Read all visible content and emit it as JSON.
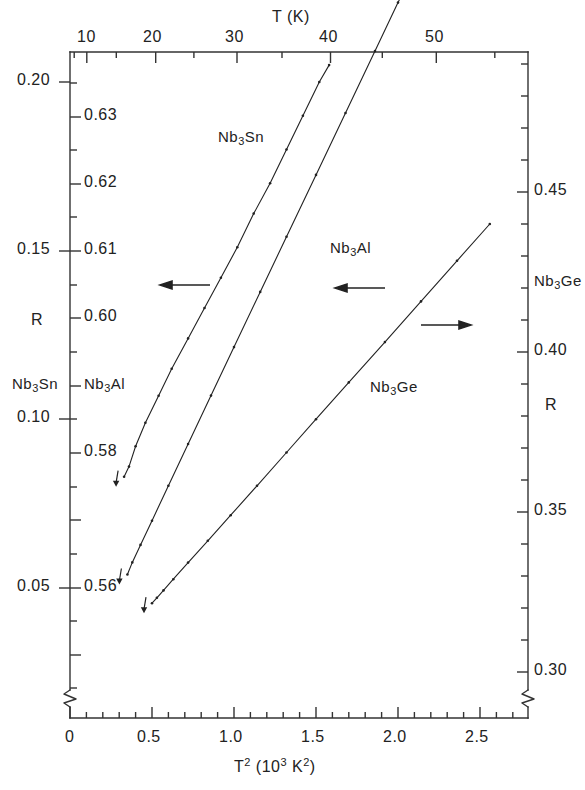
{
  "figure": {
    "background": "#ffffff",
    "ink": "#222222"
  },
  "chart_data": {
    "type": "line",
    "title": "",
    "subtitle": "",
    "xlabel_top": "T (K)",
    "xlabel_bottom": "T² (10³ K²)",
    "ylabel_left_primary": "R",
    "ylabel_right": "R",
    "grid": false,
    "legend_position": "inline-annotations",
    "axes": {
      "top": {
        "label": "T (K)",
        "ticks": [
          10,
          20,
          30,
          40,
          50
        ],
        "tick_labels": [
          "10",
          "20",
          "30",
          "40",
          "50"
        ],
        "minor_step": 5,
        "range": [
          0,
          53
        ]
      },
      "bottom": {
        "label": "T² (10³ K²)",
        "ticks": [
          0,
          0.5,
          1.0,
          1.5,
          2.0,
          2.5
        ],
        "tick_labels": [
          "0",
          "0.5",
          "1.0",
          "1.5",
          "2.0",
          "2.5"
        ],
        "minor_step": 0.1,
        "range": [
          0,
          2.8
        ],
        "axis_break": true
      },
      "left_outer": {
        "series": "Nb3Sn",
        "label": "Nb₃Sn",
        "ticks": [
          0.2,
          0.15,
          0.1,
          0.05
        ],
        "tick_labels": [
          "0.20",
          "0.15",
          "0.10",
          "0.05"
        ],
        "minor_step": 0.0125,
        "range": [
          0.035,
          0.214
        ]
      },
      "left_inner": {
        "series": "Nb3Al",
        "label": "Nb₃Al",
        "ticks": [
          0.63,
          0.62,
          0.61,
          0.6,
          0.58,
          0.56
        ],
        "tick_labels": [
          "0.63",
          "0.62",
          "0.61",
          "0.60",
          "0.58",
          "0.56"
        ],
        "minor_step": 0.005,
        "range": [
          0.549,
          0.64
        ]
      },
      "right": {
        "series": "Nb3Ge",
        "label": "Nb₃Ge",
        "ticks": [
          0.45,
          0.4,
          0.35,
          0.3
        ],
        "tick_labels": [
          "0.45",
          "0.40",
          "0.35",
          "0.30"
        ],
        "minor_step": 0.01,
        "range": [
          0.292,
          0.456
        ]
      }
    },
    "series": [
      {
        "name": "Nb₃Sn",
        "axis": "left_outer",
        "arrow_direction": "left",
        "x": [
          0.33,
          0.36,
          0.4,
          0.46,
          0.54,
          0.62,
          0.72,
          0.82,
          0.92,
          1.02,
          1.12,
          1.22,
          1.32,
          1.42,
          1.52,
          1.58
        ],
        "y": [
          0.083,
          0.086,
          0.092,
          0.099,
          0.107,
          0.115,
          0.124,
          0.133,
          0.142,
          0.151,
          0.161,
          0.17,
          0.18,
          0.19,
          0.2,
          0.205
        ]
      },
      {
        "name": "Nb₃Al",
        "axis": "left_inner",
        "arrow_direction": "left",
        "x": [
          0.35,
          0.38,
          0.43,
          0.5,
          0.6,
          0.72,
          0.86,
          1.0,
          1.16,
          1.32,
          1.5,
          1.68,
          1.86,
          2.0,
          2.08
        ],
        "y": [
          0.562,
          0.5638,
          0.5664,
          0.57,
          0.5752,
          0.5814,
          0.5886,
          0.5958,
          0.604,
          0.6122,
          0.6214,
          0.6306,
          0.6398,
          0.647,
          0.651
        ]
      },
      {
        "name": "Nb₃Ge",
        "axis": "right",
        "arrow_direction": "right",
        "x": [
          0.5,
          0.53,
          0.57,
          0.63,
          0.72,
          0.84,
          0.98,
          1.14,
          1.32,
          1.5,
          1.7,
          1.92,
          2.14,
          2.36,
          2.56
        ],
        "y": [
          0.3215,
          0.3232,
          0.3255,
          0.329,
          0.3342,
          0.341,
          0.349,
          0.3582,
          0.3686,
          0.379,
          0.3905,
          0.4031,
          0.4158,
          0.4285,
          0.44
        ]
      }
    ],
    "annotations": [
      {
        "text": "Nb₃Sn",
        "kind": "curve-label",
        "series": "Nb3Sn"
      },
      {
        "text": "Nb₃Al",
        "kind": "curve-label",
        "series": "Nb3Al"
      },
      {
        "text": "Nb₃Ge",
        "kind": "curve-label",
        "series": "Nb3Ge"
      },
      {
        "text": "←",
        "kind": "axis-pointer",
        "series": "Nb3Sn",
        "points_to": "left_outer"
      },
      {
        "text": "←",
        "kind": "axis-pointer",
        "series": "Nb3Al",
        "points_to": "left_inner"
      },
      {
        "text": "→",
        "kind": "axis-pointer",
        "series": "Nb3Ge",
        "points_to": "right"
      }
    ]
  },
  "labels": {
    "top_axis_title": "T (K)",
    "top_ticks": [
      "10",
      "20",
      "30",
      "40",
      "50"
    ],
    "bottom_ticks": [
      "0",
      "0.5",
      "1.0",
      "1.5",
      "2.0",
      "2.5"
    ],
    "bottom_axis_title_base": "T",
    "bottom_axis_title_sup": "2",
    "bottom_axis_title_mid": " (10",
    "bottom_axis_title_sup2": "3",
    "bottom_axis_title_k": " K",
    "bottom_axis_title_sup3": "2",
    "bottom_axis_title_close": ")",
    "left_outer_ticks": [
      "0.20",
      "0.15",
      "0.10",
      "0.05"
    ],
    "left_inner_ticks": [
      "0.63",
      "0.62",
      "0.61",
      "0.60",
      "0.58",
      "0.56"
    ],
    "right_ticks": [
      "0.45",
      "0.40",
      "0.35",
      "0.30"
    ],
    "left_axis_R": "R",
    "right_axis_R": "R",
    "left_series_sn": "Nb",
    "left_series_sn_sub": "3",
    "left_series_sn_tail": "Sn",
    "left_series_al": "Nb",
    "left_series_al_sub": "3",
    "left_series_al_tail": "Al",
    "right_series_ge": "Nb",
    "right_series_ge_sub": "3",
    "right_series_ge_tail": "Ge",
    "curve_sn": "Nb",
    "curve_sn_sub": "3",
    "curve_sn_tail": "Sn",
    "curve_al": "Nb",
    "curve_al_sub": "3",
    "curve_al_tail": "Al",
    "curve_ge": "Nb",
    "curve_ge_sub": "3",
    "curve_ge_tail": "Ge"
  }
}
